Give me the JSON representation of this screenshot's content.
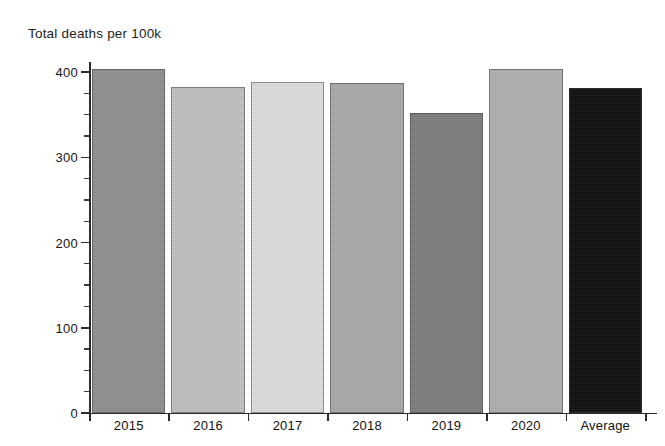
{
  "chart_data": {
    "type": "bar",
    "title": "Total deaths per 100k",
    "xlabel": "",
    "ylabel": "",
    "ylim": [
      0,
      430
    ],
    "grid": false,
    "legend": null,
    "categories": [
      "2015",
      "2016",
      "2017",
      "2018",
      "2019",
      "2020",
      "Average"
    ],
    "values": [
      404,
      382,
      388,
      387,
      352,
      404,
      381
    ],
    "ytick_labels": [
      "0",
      "100",
      "200",
      "300",
      "400"
    ],
    "ytick_values": [
      0,
      100,
      200,
      300,
      400
    ],
    "yminor_step": 25,
    "bar_colors": [
      "#8f8f8f",
      "#c2c2c2",
      "#dedede",
      "#aaaaaa",
      "#7d7d7d",
      "#b0b0b0",
      "#0d0d0d"
    ]
  },
  "axis": {
    "y_label_400": "400",
    "y_label_300": "300",
    "y_label_200": "200",
    "y_label_100": "100",
    "y_label_0": "0"
  }
}
